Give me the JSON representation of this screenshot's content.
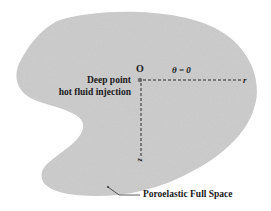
{
  "diagram": {
    "type": "schematic",
    "colors": {
      "background": "#ffffff",
      "region_fill": "#c8c8c8",
      "text": "#1a1a1a",
      "axis_line": "#2a2a2a"
    },
    "labels": {
      "origin": "O",
      "source_line1": "Deep point",
      "source_line2": "hot fluid injection",
      "theta": "θ = 0",
      "r_axis": "r",
      "z_axis": "z",
      "region": "Poroelastic Full Space"
    },
    "axes": [
      {
        "name": "r",
        "direction": "horizontal-right",
        "style": "dashed"
      },
      {
        "name": "z",
        "direction": "vertical-down",
        "style": "dashed"
      }
    ]
  }
}
